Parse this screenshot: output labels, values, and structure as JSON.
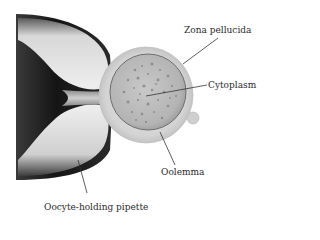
{
  "figure": {
    "type": "scientific-illustration",
    "colors": {
      "background": "#ffffff",
      "pipette_dark": "#1e1e1e",
      "pipette_light": "#e6e6e6",
      "zona": "#d2d2d2",
      "cytoplasm": "#b9b9b9",
      "granules": "#7a7a7a",
      "leader_line": "#333333",
      "text": "#2a2a2a"
    }
  },
  "labels": {
    "zona_pellucida": "Zona pellucida",
    "cytoplasm": "Cytoplasm",
    "oolemma": "Oolemma",
    "pipette": "Oocyte-holding pipette"
  }
}
